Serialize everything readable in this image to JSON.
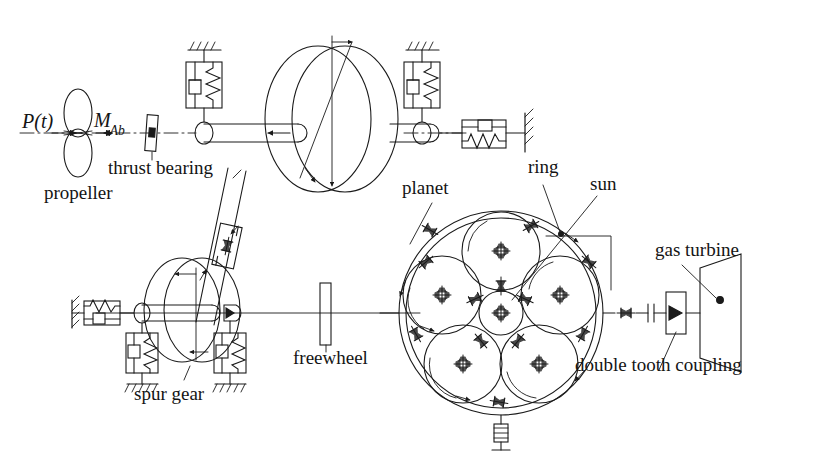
{
  "figure": {
    "kind": "mechanical-drivetrain-schematic",
    "title_visible": false,
    "background_color": "#ffffff",
    "line_color": "#1a1a1a",
    "text_color": "#141414"
  },
  "labels": {
    "excitation_force": "P(t)",
    "moment_symbol_base": "M",
    "moment_symbol_sub": "Ab",
    "propeller": "propeller",
    "thrust_bearing": "thrust bearing",
    "planet": "planet",
    "ring": "ring",
    "sun": "sun",
    "gas_turbine": "gas turbine",
    "double_tooth_coupling": "double tooth coupling",
    "freewheel": "freewheel",
    "spur_gear": "spur gear"
  },
  "components": [
    {
      "id": "propeller",
      "name": "propeller",
      "type": "figure-eight-blade",
      "label": "propeller"
    },
    {
      "id": "thrust-bearing",
      "name": "thrust bearing",
      "type": "axial-bearing",
      "label": "thrust bearing"
    },
    {
      "id": "propeller-rotor",
      "name": "propeller shaft rotor",
      "type": "disc-flywheel"
    },
    {
      "id": "planet",
      "name": "planet gear",
      "type": "planet-gear",
      "label": "planet",
      "count": 5
    },
    {
      "id": "ring",
      "name": "ring gear",
      "type": "ring-gear",
      "label": "ring"
    },
    {
      "id": "sun",
      "name": "sun gear",
      "type": "sun-gear",
      "label": "sun"
    },
    {
      "id": "gas-turbine",
      "name": "gas turbine",
      "type": "turbine-trapezoid",
      "label": "gas turbine"
    },
    {
      "id": "double-tooth-coupling",
      "name": "double tooth coupling",
      "type": "coupling",
      "label": "double tooth coupling"
    },
    {
      "id": "freewheel",
      "name": "freewheel",
      "type": "overrunning-clutch",
      "label": "freewheel"
    },
    {
      "id": "spur-gear",
      "name": "spur gear",
      "type": "spur-gear",
      "label": "spur gear"
    }
  ],
  "symbols": {
    "spring_damper_pairs": 7,
    "ground_hatches": 6,
    "bearings": 5,
    "rotation_arrows": 6
  }
}
